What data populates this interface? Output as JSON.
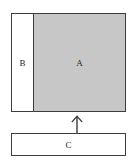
{
  "figure": {
    "type": "schematic-diagram",
    "background_color": "#ffffff",
    "stroke_color": "#3d3d3d",
    "shapes": {
      "main_box": {
        "name": "main-box",
        "regions": [
          {
            "id": "b",
            "label": "B",
            "fill_color": "#ffffff",
            "position": "left"
          },
          {
            "id": "a",
            "label": "A",
            "fill_color": "#c7c7c7",
            "position": "right"
          }
        ]
      },
      "bottom_box": {
        "name": "c-box",
        "label": "C",
        "fill_color": "#ffffff"
      }
    },
    "connector": {
      "id": "arrow-up",
      "icon": "arrow-up-icon",
      "direction": "up",
      "from": "C",
      "to": "A",
      "color": "#3d3d3d"
    }
  }
}
